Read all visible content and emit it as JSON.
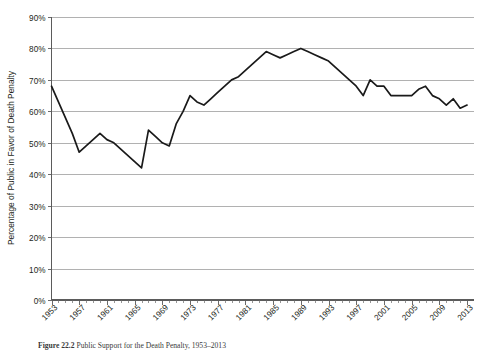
{
  "figure": {
    "caption_label": "Figure 22.2",
    "caption_text": "Public Support for the Death Penalty, 1953–2013"
  },
  "chart_data": {
    "type": "line",
    "title": "",
    "xlabel": "",
    "ylabel": "Percentage of Public in Favor of Death Penalty",
    "ylim": [
      0,
      90
    ],
    "xlim": [
      1953,
      2014
    ],
    "grid": true,
    "legend": "none",
    "y_ticks": [
      0,
      10,
      20,
      30,
      40,
      50,
      60,
      70,
      80,
      90
    ],
    "y_tick_labels": [
      "0%",
      "10%",
      "20%",
      "30%",
      "40%",
      "50%",
      "60%",
      "70%",
      "80%",
      "90%"
    ],
    "x_tick_labels": [
      "1953",
      "1957",
      "1961",
      "1965",
      "1969",
      "1973",
      "1977",
      "1981",
      "1985",
      "1989",
      "1993",
      "1997",
      "2001",
      "2005",
      "2009",
      "2013"
    ],
    "x_tick_label_step": 4,
    "x_minor_tick_step": 1,
    "series": [
      {
        "name": "Percentage of Public in Favor of Death Penalty",
        "color": "#1a1a1a",
        "x": [
          1953,
          1954,
          1955,
          1956,
          1957,
          1958,
          1959,
          1960,
          1961,
          1962,
          1963,
          1964,
          1965,
          1966,
          1967,
          1968,
          1969,
          1970,
          1971,
          1972,
          1973,
          1974,
          1975,
          1976,
          1977,
          1978,
          1979,
          1980,
          1981,
          1982,
          1983,
          1984,
          1985,
          1986,
          1987,
          1988,
          1989,
          1990,
          1991,
          1992,
          1993,
          1994,
          1995,
          1996,
          1997,
          1998,
          1999,
          2000,
          2001,
          2002,
          2003,
          2004,
          2005,
          2006,
          2007,
          2008,
          2009,
          2010,
          2011,
          2012,
          2013
        ],
        "y": [
          68,
          63,
          58,
          53,
          47,
          49,
          51,
          53,
          51,
          50,
          48,
          46,
          44,
          42,
          54,
          52,
          50,
          49,
          56,
          60,
          65,
          63,
          62,
          64,
          66,
          68,
          70,
          71,
          73,
          75,
          77,
          79,
          78,
          77,
          78,
          79,
          80,
          79,
          78,
          77,
          76,
          74,
          72,
          70,
          68,
          65,
          70,
          68,
          68,
          65,
          65,
          65,
          65,
          67,
          68,
          65,
          64,
          62,
          64,
          61,
          62
        ]
      }
    ]
  }
}
